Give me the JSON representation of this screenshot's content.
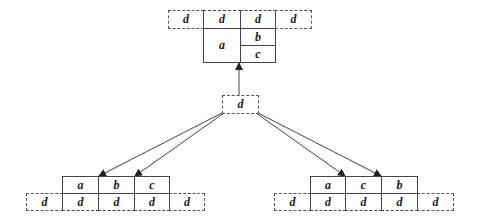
{
  "colors": {
    "line": "#444444",
    "dashed": "#555555",
    "text": "#1a1a1a",
    "background": "#ffffff"
  },
  "top_structure": {
    "dashed_row": [
      "d",
      "d",
      "d",
      "d"
    ],
    "solid_left": "a",
    "solid_right": [
      "b",
      "c"
    ]
  },
  "middle_node": {
    "label": "d"
  },
  "bottom_left": {
    "solid_row": [
      "a",
      "b",
      "c"
    ],
    "dashed_row": [
      "d",
      "d",
      "d",
      "d",
      "d"
    ]
  },
  "bottom_right": {
    "solid_row": [
      "a",
      "c",
      "b"
    ],
    "dashed_row": [
      "d",
      "d",
      "d",
      "d",
      "d"
    ]
  },
  "arrows": [
    {
      "from": "middle_node",
      "to": "top_structure"
    },
    {
      "from": "middle_node",
      "to": "bottom_left.b"
    },
    {
      "from": "middle_node",
      "to": "bottom_left.c"
    },
    {
      "from": "middle_node",
      "to": "bottom_right.c"
    },
    {
      "from": "middle_node",
      "to": "bottom_right.b"
    }
  ]
}
